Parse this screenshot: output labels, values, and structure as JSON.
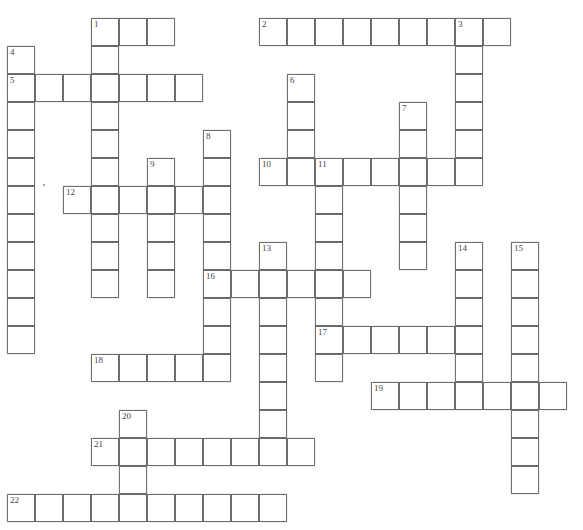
{
  "puzzle": {
    "type": "crossword",
    "cell_size": 28,
    "origin": {
      "x": 7,
      "y": 18
    },
    "line_color": "#6f6f6f",
    "cell_fill": "#ffffff",
    "across": [
      {
        "number": "1",
        "row": 0,
        "col": 3,
        "length": 3
      },
      {
        "number": "2",
        "row": 0,
        "col": 9,
        "length": 9
      },
      {
        "number": "5",
        "row": 2,
        "col": 0,
        "length": 7
      },
      {
        "number": "10",
        "row": 5,
        "col": 9,
        "length": 8
      },
      {
        "number": "12",
        "row": 6,
        "col": 2,
        "length": 6
      },
      {
        "number": "16",
        "row": 9,
        "col": 7,
        "length": 6
      },
      {
        "number": "17",
        "row": 11,
        "col": 11,
        "length": 6
      },
      {
        "number": "18",
        "row": 12,
        "col": 3,
        "length": 5
      },
      {
        "number": "19",
        "row": 13,
        "col": 13,
        "length": 7
      },
      {
        "number": "21",
        "row": 15,
        "col": 3,
        "length": 8
      },
      {
        "number": "22",
        "row": 17,
        "col": 0,
        "length": 10
      }
    ],
    "down": [
      {
        "number": "1",
        "row": 0,
        "col": 3,
        "length": 10
      },
      {
        "number": "3",
        "row": 0,
        "col": 16,
        "length": 6
      },
      {
        "number": "4",
        "row": 1,
        "col": 0,
        "length": 11
      },
      {
        "number": "6",
        "row": 2,
        "col": 10,
        "length": 4
      },
      {
        "number": "7",
        "row": 3,
        "col": 14,
        "length": 6
      },
      {
        "number": "8",
        "row": 4,
        "col": 7,
        "length": 9
      },
      {
        "number": "9",
        "row": 5,
        "col": 5,
        "length": 5
      },
      {
        "number": "11",
        "row": 5,
        "col": 11,
        "length": 8
      },
      {
        "number": "13",
        "row": 8,
        "col": 9,
        "length": 8
      },
      {
        "number": "14",
        "row": 8,
        "col": 16,
        "length": 6
      },
      {
        "number": "15",
        "row": 8,
        "col": 18,
        "length": 9
      },
      {
        "number": "20",
        "row": 14,
        "col": 4,
        "length": 4
      }
    ]
  }
}
